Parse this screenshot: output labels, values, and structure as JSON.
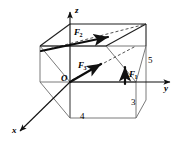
{
  "figure": {
    "type": "3d-vector-diagram",
    "background_color": "#ffffff",
    "line_color": "#1a1a1a",
    "edge_color": "#555555",
    "axes": [
      {
        "name": "x-axis",
        "label": "x"
      },
      {
        "name": "y-axis",
        "label": "y"
      },
      {
        "name": "z-axis",
        "label": "z"
      }
    ],
    "origin": {
      "label": "O"
    },
    "forces": [
      {
        "name": "F1",
        "base": "F",
        "sub": "1"
      },
      {
        "name": "F2",
        "base": "F",
        "sub": "2"
      },
      {
        "name": "F3",
        "base": "F",
        "sub": "3"
      }
    ],
    "dimensions": [
      {
        "name": "depth-x",
        "value": "4"
      },
      {
        "name": "width-y",
        "value": "3"
      },
      {
        "name": "height-z",
        "value": "5"
      }
    ]
  }
}
